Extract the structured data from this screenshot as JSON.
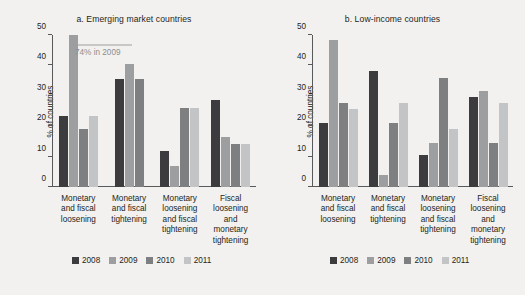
{
  "figure": {
    "ylabel": "% of countries",
    "footer": ""
  },
  "chart_data": [
    {
      "type": "bar",
      "title": "a.  Emerging market countries",
      "panel_id": "a",
      "xlabel": "",
      "ylabel": "% of countries",
      "ylim": [
        0,
        50
      ],
      "yticks": [
        0,
        10,
        20,
        30,
        40,
        50
      ],
      "ytick_labels": [
        "0",
        "10",
        "20",
        "30",
        "40",
        "50"
      ],
      "grid": false,
      "legend_position": "bottom",
      "categories": [
        "Monetary and fiscal loosening",
        "Monetary and fiscal tightening",
        "Monetary loosening and fiscal tightening",
        "Fiscal loosening and monetary tightening"
      ],
      "category_lines": [
        [
          "Monetary",
          "and fiscal",
          "loosening"
        ],
        [
          "Monetary",
          "and fiscal",
          "tightening"
        ],
        [
          "Monetary",
          "loosening",
          "and fiscal",
          "tightening"
        ],
        [
          "Fiscal",
          "loosening",
          "and monetary",
          "tightening"
        ]
      ],
      "series": [
        {
          "name": "2008",
          "color": "#3c3c3e",
          "values": [
            23.5,
            35.5,
            12.0,
            28.5
          ]
        },
        {
          "name": "2009",
          "color": "#9d9e9f",
          "values": [
            50.0,
            40.5,
            7.0,
            16.5
          ]
        },
        {
          "name": "2010",
          "color": "#7e7f81",
          "values": [
            19.0,
            35.5,
            26.0,
            14.0
          ]
        },
        {
          "name": "2011",
          "color": "#c3c4c5",
          "values": [
            23.5,
            0.0,
            26.0,
            14.0
          ]
        }
      ],
      "annotations": [
        {
          "text": "74% in 2009",
          "target_series": "2009",
          "target_category": "Monetary and fiscal loosening",
          "color": "#8d8e90"
        }
      ]
    },
    {
      "type": "bar",
      "title": "b.  Low-income countries",
      "panel_id": "b",
      "xlabel": "",
      "ylabel": "% of countries",
      "ylim": [
        0,
        50
      ],
      "yticks": [
        0,
        10,
        20,
        30,
        40,
        50
      ],
      "ytick_labels": [
        "0",
        "10",
        "20",
        "30",
        "40",
        "50"
      ],
      "grid": false,
      "legend_position": "bottom",
      "categories": [
        "Monetary and fiscal loosening",
        "Monetary and fiscal tightening",
        "Monetary loosening and fiscal tightening",
        "Fiscal loosening and monetary tightening"
      ],
      "category_lines": [
        [
          "Monetary",
          "and fiscal",
          "loosening"
        ],
        [
          "Monetary",
          "and fiscal",
          "tightening"
        ],
        [
          "Monetary",
          "loosening",
          "and fiscal",
          "tightening"
        ],
        [
          "Fiscal",
          "loosening",
          "and monetary",
          "tightening"
        ]
      ],
      "series": [
        {
          "name": "2008",
          "color": "#3c3c3e",
          "values": [
            21.0,
            38.0,
            10.5,
            29.5
          ]
        },
        {
          "name": "2009",
          "color": "#9d9e9f",
          "values": [
            48.5,
            4.0,
            14.5,
            31.5
          ]
        },
        {
          "name": "2010",
          "color": "#7e7f81",
          "values": [
            27.5,
            21.0,
            36.0,
            14.5
          ]
        },
        {
          "name": "2011",
          "color": "#c3c4c5",
          "values": [
            25.5,
            27.5,
            19.0,
            27.5
          ]
        }
      ],
      "annotations": []
    }
  ]
}
